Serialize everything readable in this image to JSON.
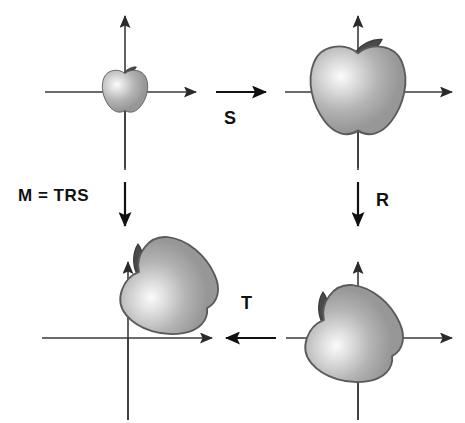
{
  "figure": {
    "background_color": "#ffffff",
    "axis_color": "#3a3a3a",
    "label_color": "#111111",
    "apple_body_color": "#b0b0b0",
    "apple_highlight_color": "#f2f2f2",
    "apple_outline_color": "#555555",
    "apple_stem_color": "#4a4a4a"
  },
  "labels": {
    "scale": "S",
    "rotate": "R",
    "translate": "T",
    "composite": "M = TRS"
  },
  "panels": [
    {
      "id": "top-left",
      "name": "original-object",
      "origin": {
        "x": 125,
        "y": 92
      },
      "apple": {
        "cx": 125,
        "cy": 92,
        "scale": 0.44,
        "rotation": 0,
        "offset_x": 0,
        "offset_y": 0
      },
      "caption": "original"
    },
    {
      "id": "top-right",
      "name": "scaled-object",
      "origin": {
        "x": 358,
        "y": 92
      },
      "apple": {
        "cx": 358,
        "cy": 92,
        "scale": 0.92,
        "rotation": 0,
        "offset_x": 0,
        "offset_y": 0
      },
      "caption": "after S"
    },
    {
      "id": "bottom-right",
      "name": "rotated-object",
      "origin": {
        "x": 358,
        "y": 338
      },
      "apple": {
        "cx": 358,
        "cy": 338,
        "scale": 0.92,
        "rotation": -62,
        "offset_x": 0,
        "offset_y": 0
      },
      "caption": "after R"
    },
    {
      "id": "bottom-left",
      "name": "translated-object",
      "origin": {
        "x": 128,
        "y": 338
      },
      "apple": {
        "cx": 128,
        "cy": 338,
        "scale": 0.92,
        "rotation": -62,
        "offset_x": 45,
        "offset_y": -48
      },
      "caption": "after T"
    }
  ],
  "operation_arrows": [
    {
      "name": "scale-arrow",
      "direction": "right",
      "x1": 218,
      "y1": 92,
      "x2": 268,
      "y2": 92,
      "label": "S"
    },
    {
      "name": "rotate-arrow",
      "direction": "down",
      "x1": 358,
      "y1": 180,
      "x2": 358,
      "y2": 228,
      "label": "R"
    },
    {
      "name": "translate-arrow",
      "direction": "left",
      "x1": 272,
      "y1": 338,
      "x2": 222,
      "y2": 338,
      "label": "T"
    },
    {
      "name": "composite-arrow",
      "direction": "down",
      "x1": 125,
      "y1": 180,
      "x2": 125,
      "y2": 228,
      "label": "M = TRS"
    }
  ]
}
